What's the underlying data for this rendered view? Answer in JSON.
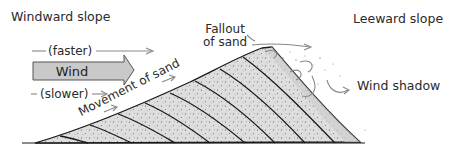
{
  "diagram": {
    "title_left": "Windward slope",
    "title_right": "Leeward slope",
    "labels": {
      "faster": "(faster)",
      "wind": "Wind",
      "slower": "(slower)",
      "movement": "Movement of sand",
      "fallout_line1": "Fallout",
      "fallout_line2": "of sand",
      "wind_shadow": "Wind shadow"
    },
    "colors": {
      "wind_arrow_fill": "#c9c9c9",
      "sand_fill": "#dcdcdc",
      "lines": "#1a1a1a",
      "arrows": "#888888"
    }
  }
}
